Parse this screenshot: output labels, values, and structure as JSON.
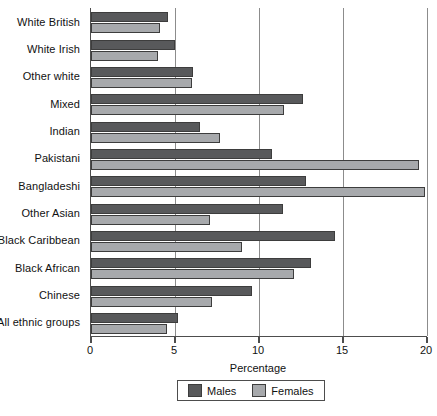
{
  "chart_data": {
    "type": "bar",
    "orientation": "horizontal",
    "title": "",
    "xlabel": "Percentage",
    "ylabel": "",
    "xlim": [
      0,
      20
    ],
    "xticks": [
      0,
      5,
      10,
      15,
      20
    ],
    "xtick_labels": [
      "0",
      "5",
      "10",
      "15",
      "20"
    ],
    "grid": true,
    "legend_position": "bottom",
    "categories": [
      "White British",
      "White Irish",
      "Other white",
      "Mixed",
      "Indian",
      "Pakistani",
      "Bangladeshi",
      "Other Asian",
      "Black Caribbean",
      "Black African",
      "Chinese",
      "All ethnic groups"
    ],
    "series": [
      {
        "name": "Males",
        "color": "#58595b",
        "values": [
          4.6,
          5.0,
          6.1,
          12.6,
          6.5,
          10.8,
          12.8,
          11.4,
          14.5,
          13.1,
          9.6,
          5.2
        ]
      },
      {
        "name": "Females",
        "color": "#a7a9ac",
        "values": [
          4.1,
          4.0,
          6.0,
          11.5,
          7.7,
          19.5,
          19.9,
          7.1,
          9.0,
          12.1,
          7.2,
          4.5
        ]
      }
    ]
  },
  "legend": {
    "items": [
      {
        "label": "Males",
        "color": "#58595b"
      },
      {
        "label": "Females",
        "color": "#a7a9ac"
      }
    ]
  }
}
